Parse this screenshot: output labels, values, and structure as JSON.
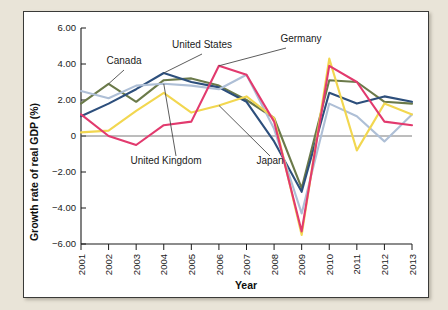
{
  "figure": {
    "background_color": "#e9e4d8",
    "card_color": "#ffffff",
    "border_color": "#3a3a38"
  },
  "chart_data": {
    "type": "line",
    "title": "",
    "xlabel": "Year",
    "ylabel": "Growth rate of real GDP (%)",
    "x": [
      2001,
      2002,
      2003,
      2004,
      2005,
      2006,
      2007,
      2008,
      2009,
      2010,
      2011,
      2012,
      2013
    ],
    "categories": [
      "2001",
      "2002",
      "2003",
      "2004",
      "2005",
      "2006",
      "2007",
      "2008",
      "2009",
      "2010",
      "2011",
      "2012",
      "2013"
    ],
    "xlim": [
      2001,
      2013
    ],
    "ylim": [
      -6.0,
      6.0
    ],
    "yticks": [
      6.0,
      4.0,
      2.0,
      0,
      -2.0,
      -4.0,
      -6.0
    ],
    "ytick_labels": [
      "6.00",
      "4.00",
      "2.00",
      "0",
      "−2.00",
      "−4.00",
      "−6.00"
    ],
    "grid": false,
    "legend_position": "inline-annotations",
    "zero_line": true,
    "series": [
      {
        "name": "Canada",
        "color": "#6b7a4a",
        "values": [
          1.8,
          2.9,
          1.9,
          3.1,
          3.2,
          2.8,
          2.0,
          1.0,
          -2.9,
          3.1,
          3.0,
          1.9,
          1.8
        ]
      },
      {
        "name": "United States",
        "color": "#2d4f7c",
        "values": [
          1.1,
          1.8,
          2.6,
          3.5,
          3.0,
          2.7,
          1.9,
          -0.3,
          -3.1,
          2.4,
          1.8,
          2.2,
          1.9
        ]
      },
      {
        "name": "United Kingdom",
        "color": "#aebfd6",
        "values": [
          2.5,
          2.1,
          2.8,
          2.9,
          2.8,
          2.6,
          3.4,
          0.4,
          -4.3,
          1.8,
          1.1,
          -0.3,
          1.2
        ]
      },
      {
        "name": "Japan",
        "color": "#f2d750",
        "values": [
          0.2,
          0.3,
          1.4,
          2.4,
          1.3,
          1.7,
          2.2,
          1.0,
          -5.5,
          4.3,
          -0.8,
          1.8,
          1.2
        ]
      },
      {
        "name": "Germany",
        "color": "#e23a6e",
        "values": [
          1.2,
          0.0,
          -0.5,
          0.6,
          0.8,
          3.9,
          3.4,
          0.8,
          -5.3,
          3.9,
          3.0,
          0.8,
          0.6
        ]
      }
    ],
    "annotations": [
      {
        "label": "Canada",
        "target_year": 2002,
        "target_value": 2.9
      },
      {
        "label": "United States",
        "target_year": 2004,
        "target_value": 3.5
      },
      {
        "label": "Germany",
        "target_year": 2006,
        "target_value": 3.9
      },
      {
        "label": "United Kingdom",
        "target_year": 2004,
        "target_value": 2.9
      },
      {
        "label": "Japan",
        "target_year": 2006,
        "target_value": 1.7
      }
    ]
  }
}
